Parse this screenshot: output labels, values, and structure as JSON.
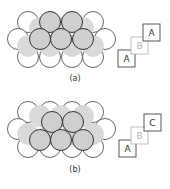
{
  "figure": {
    "panels": [
      {
        "id": "a",
        "caption": "(a)",
        "stacking_sequence": [
          "A",
          "B",
          "A"
        ],
        "layers": [
          {
            "name": "A",
            "role": "bottom layer",
            "style": "white"
          },
          {
            "name": "B",
            "role": "middle layer",
            "style": "light-gray"
          },
          {
            "name": "A",
            "role": "top layer",
            "style": "gray-dark-outline"
          }
        ]
      },
      {
        "id": "b",
        "caption": "(b)",
        "stacking_sequence": [
          "A",
          "B",
          "C"
        ],
        "layers": [
          {
            "name": "A",
            "role": "bottom layer",
            "style": "white"
          },
          {
            "name": "B",
            "role": "middle layer",
            "style": "light-gray"
          },
          {
            "name": "C",
            "role": "top layer",
            "style": "gray-dark-outline"
          }
        ]
      }
    ],
    "colors": {
      "white_fill": "#ffffff",
      "white_stroke": "#555555",
      "b_fill": "#d9d9d9",
      "b_stroke": "#d0d0d0",
      "top_fill": "#cfcfcf",
      "top_stroke": "#333333",
      "square_dark": "#444444",
      "square_light": "#b5b5b5"
    }
  }
}
